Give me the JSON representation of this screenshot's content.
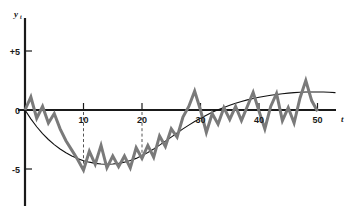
{
  "chart_data": {
    "type": "line",
    "title": "",
    "xlabel": "t",
    "ylabel": "y",
    "ylabel_sub": "t",
    "xlim": [
      -1,
      55
    ],
    "ylim": [
      -7.2,
      8.5
    ],
    "grid": false,
    "legend": null,
    "x_ticks": [
      10,
      20,
      30,
      40,
      50
    ],
    "x_tick_labels": [
      "10",
      "20",
      "30",
      "40",
      "50"
    ],
    "y_ticks": [
      5,
      0,
      -5
    ],
    "y_tick_labels": [
      "+5",
      "0",
      "-5"
    ],
    "annotations": {
      "dashed_verticals": [
        10,
        20
      ]
    },
    "series": [
      {
        "name": "observed",
        "color": "#7a7a7a",
        "linewidth": 3.0,
        "x": [
          0,
          1,
          2,
          3,
          4,
          5,
          6,
          7,
          8,
          9,
          10,
          11,
          12,
          13,
          14,
          15,
          16,
          17,
          18,
          19,
          20,
          21,
          22,
          23,
          24,
          25,
          26,
          27,
          28,
          29,
          30,
          31,
          32,
          33,
          34,
          35,
          36,
          37,
          38,
          39,
          40,
          41,
          42,
          43,
          44,
          45,
          46,
          47,
          48,
          49,
          50
        ],
        "values": [
          0.0,
          1.1,
          -0.7,
          0.3,
          -1.1,
          -0.3,
          -1.6,
          -2.6,
          -3.4,
          -4.2,
          -5.1,
          -3.5,
          -4.6,
          -3.0,
          -4.9,
          -3.9,
          -4.8,
          -3.9,
          -4.9,
          -3.2,
          -4.1,
          -3.0,
          -4.0,
          -2.2,
          -3.1,
          -1.6,
          -2.3,
          -0.6,
          0.3,
          1.6,
          0.0,
          -1.9,
          -0.3,
          -1.2,
          0.2,
          -0.8,
          0.3,
          -0.9,
          0.3,
          1.5,
          -0.1,
          -1.6,
          0.3,
          1.4,
          -0.9,
          0.2,
          -1.1,
          1.0,
          2.5,
          0.8,
          -0.1
        ]
      },
      {
        "name": "trend",
        "color": "#111111",
        "linewidth": 1.1,
        "x": [
          0,
          1,
          2,
          3,
          4,
          5,
          6,
          7,
          8,
          9,
          10,
          11,
          12,
          13,
          14,
          15,
          16,
          17,
          18,
          19,
          20,
          21,
          22,
          23,
          24,
          25,
          26,
          27,
          28,
          29,
          30,
          31,
          32,
          33,
          34,
          35,
          36,
          37,
          38,
          39,
          40,
          41,
          42,
          43,
          44,
          45,
          46,
          47,
          48,
          49,
          50,
          51,
          52,
          53
        ],
        "values": [
          0.0,
          -0.75,
          -1.42,
          -2.0,
          -2.5,
          -2.93,
          -3.3,
          -3.62,
          -3.9,
          -4.12,
          -4.3,
          -4.42,
          -4.52,
          -4.58,
          -4.6,
          -4.58,
          -4.52,
          -4.42,
          -4.28,
          -4.1,
          -3.86,
          -3.6,
          -3.3,
          -2.98,
          -2.64,
          -2.3,
          -1.95,
          -1.6,
          -1.28,
          -0.98,
          -0.7,
          -0.44,
          -0.2,
          0.02,
          0.22,
          0.4,
          0.57,
          0.72,
          0.86,
          0.98,
          1.08,
          1.17,
          1.25,
          1.32,
          1.38,
          1.43,
          1.47,
          1.5,
          1.52,
          1.53,
          1.53,
          1.52,
          1.5,
          1.47
        ]
      }
    ]
  },
  "axes": {
    "x_axis_name": "t",
    "y_axis_name": "y"
  }
}
